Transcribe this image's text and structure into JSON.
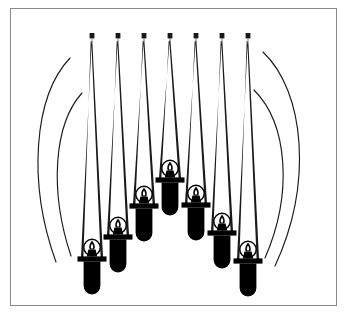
{
  "artwork": {
    "title": "Candle Arch Illustration",
    "description": "Black-and-white line illustration of seven hanging candles arranged in an arch, each suspended inside a narrow triangular wire cone, flanked by four concentric arcs.",
    "medium": "line-art",
    "background_color": "#ffffff",
    "ink_color": "#000000",
    "frame_color": "#8a8a8a",
    "frame": {
      "x": 10,
      "y": 8,
      "width": 327,
      "height": 298,
      "stroke_width": 1
    },
    "canvas": {
      "width": 347,
      "height": 321
    },
    "counts": {
      "candles": 7,
      "cones": 7,
      "arcs": 4
    },
    "candles": [
      {
        "id": "candle-1",
        "cx": 92,
        "apex_y": 35,
        "top_y": 238,
        "cone_half_width": 11,
        "scale": 1.0
      },
      {
        "id": "candle-2",
        "cx": 118,
        "apex_y": 35,
        "top_y": 216,
        "cone_half_width": 11,
        "scale": 1.0
      },
      {
        "id": "candle-3",
        "cx": 144,
        "apex_y": 35,
        "top_y": 185,
        "cone_half_width": 11,
        "scale": 1.0
      },
      {
        "id": "candle-4",
        "cx": 170,
        "apex_y": 35,
        "top_y": 159,
        "cone_half_width": 11,
        "scale": 1.0
      },
      {
        "id": "candle-5",
        "cx": 196,
        "apex_y": 35,
        "top_y": 184,
        "cone_half_width": 11,
        "scale": 1.0
      },
      {
        "id": "candle-6",
        "cx": 222,
        "apex_y": 35,
        "top_y": 212,
        "cone_half_width": 11,
        "scale": 1.0
      },
      {
        "id": "candle-7",
        "cx": 248,
        "apex_y": 35,
        "top_y": 240,
        "cone_half_width": 11,
        "scale": 1.0
      }
    ],
    "arcs": [
      {
        "id": "arc-left-outer",
        "side": "left",
        "d": "M 70,58 C 34,96 27,182 56,262"
      },
      {
        "id": "arc-left-inner",
        "side": "left",
        "d": "M 82,93 C 54,124 49,190 71,256"
      },
      {
        "id": "arc-right-outer",
        "side": "right",
        "d": "M 263,52 C 305,92 313,184 275,266"
      },
      {
        "id": "arc-right-inner",
        "side": "right",
        "d": "M 254,90 C 288,124 293,194 265,258"
      }
    ]
  }
}
